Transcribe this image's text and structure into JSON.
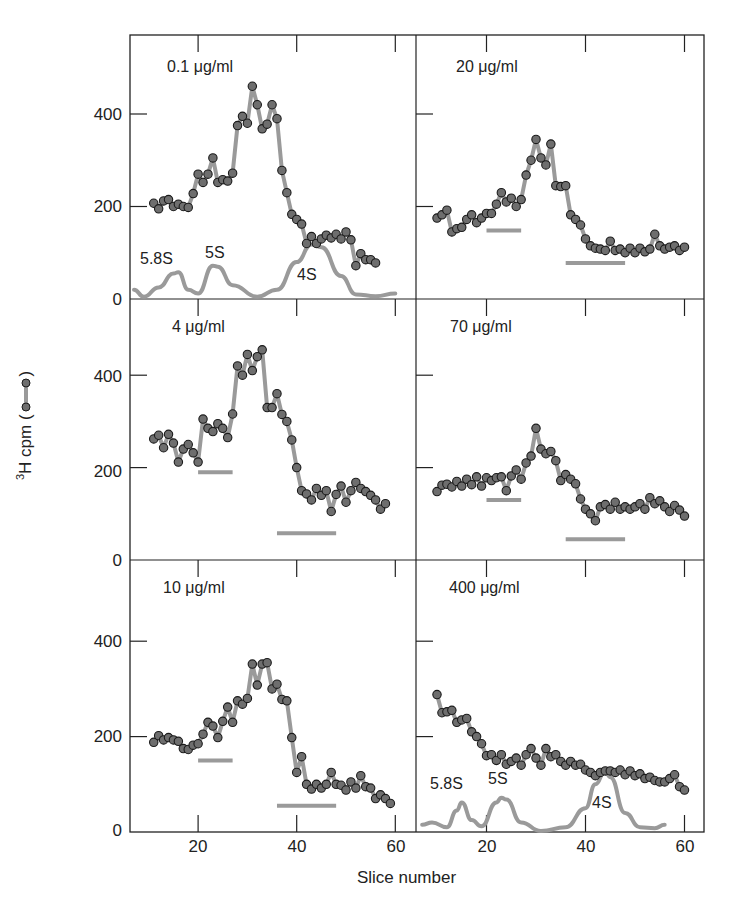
{
  "figure": {
    "xlabel": "Slice number",
    "ylabel_sup": "3",
    "ylabel_main": "H cpm (",
    "ylabel_end": ")",
    "legend_symbol": "line-with-dots",
    "colors": {
      "frame": "#222222",
      "trace_line": "#9a9a9a",
      "dot_fill": "#6e6e6e",
      "dot_stroke": "#1a1a1a",
      "marker_curve": "#9a9a9a",
      "bar": "#9a9a9a"
    }
  },
  "axes": {
    "y_ticks": [
      "0",
      "200",
      "400"
    ],
    "x_ticks": [
      "20",
      "40",
      "60"
    ]
  },
  "chart_data": {
    "type": "line",
    "title": "",
    "xlabel": "Slice number",
    "ylabel": "3H cpm",
    "x_ticks": [
      20,
      40,
      60
    ],
    "y_ticks": [
      0,
      200,
      400
    ],
    "grid": false,
    "layout": "3 rows x 2 columns of panels, shared axes",
    "panels": [
      {
        "label": "0.1 μg/ml",
        "row": 0,
        "col": 0,
        "x": [
          11,
          12,
          13,
          14,
          15,
          16,
          17,
          18,
          19,
          20,
          21,
          22,
          23,
          24,
          25,
          26,
          27,
          28,
          29,
          30,
          31,
          32,
          33,
          34,
          35,
          36,
          37,
          38,
          39,
          40,
          41,
          42,
          43,
          44,
          45,
          46,
          47,
          48,
          49,
          50,
          51,
          52,
          53,
          54,
          55,
          56,
          57,
          58,
          59,
          60
        ],
        "values": [
          207,
          195,
          212,
          215,
          200,
          205,
          200,
          198,
          228,
          270,
          252,
          270,
          305,
          252,
          258,
          255,
          272,
          375,
          395,
          380,
          460,
          420,
          368,
          378,
          420,
          390,
          278,
          230,
          183,
          172,
          162,
          120,
          135,
          120,
          130,
          138,
          132,
          140,
          130,
          145,
          128,
          72,
          98,
          85,
          85,
          78,
          null,
          null,
          null,
          null
        ],
        "markers": {
          "curve": [
            [
              7,
              20
            ],
            [
              9,
              5
            ],
            [
              12,
              25
            ],
            [
              15,
              55
            ],
            [
              16,
              58
            ],
            [
              18,
              20
            ],
            [
              20,
              12
            ],
            [
              23,
              72
            ],
            [
              24,
              70
            ],
            [
              27,
              30
            ],
            [
              32,
              5
            ],
            [
              36,
              20
            ],
            [
              40,
              80
            ],
            [
              43,
              118
            ],
            [
              45,
              112
            ],
            [
              49,
              50
            ],
            [
              52,
              10
            ],
            [
              56,
              6
            ],
            [
              60,
              12
            ]
          ],
          "labels": [
            {
              "text": "5.8S",
              "x": 14,
              "y": 92
            },
            {
              "text": "5S",
              "x": 24,
              "y": 100
            },
            {
              "text": "4S",
              "x": 44,
              "y": 48
            }
          ]
        },
        "bars": []
      },
      {
        "label": "20 μg/ml",
        "row": 0,
        "col": 1,
        "x": [
          10,
          11,
          12,
          13,
          14,
          15,
          16,
          17,
          18,
          19,
          20,
          21,
          22,
          23,
          24,
          25,
          26,
          27,
          28,
          29,
          30,
          31,
          32,
          33,
          34,
          35,
          36,
          37,
          38,
          39,
          40,
          41,
          42,
          43,
          44,
          45,
          46,
          47,
          48,
          49,
          50,
          51,
          52,
          53,
          54,
          55,
          56,
          57,
          58,
          59,
          60
        ],
        "values": [
          175,
          182,
          192,
          145,
          152,
          155,
          172,
          182,
          165,
          175,
          185,
          185,
          205,
          230,
          210,
          218,
          200,
          215,
          268,
          300,
          345,
          305,
          290,
          335,
          245,
          243,
          245,
          182,
          172,
          160,
          130,
          115,
          110,
          108,
          105,
          125,
          105,
          108,
          100,
          110,
          100,
          110,
          102,
          108,
          140,
          115,
          108,
          112,
          115,
          105,
          112
        ],
        "markers": null,
        "bars": [
          {
            "x0": 20,
            "x1": 27,
            "y": 148
          },
          {
            "x0": 36,
            "x1": 48,
            "y": 78
          }
        ]
      },
      {
        "label": "4 μg/ml",
        "row": 1,
        "col": 0,
        "x": [
          11,
          12,
          13,
          14,
          15,
          16,
          17,
          18,
          19,
          20,
          21,
          22,
          23,
          24,
          25,
          26,
          27,
          28,
          29,
          30,
          31,
          32,
          33,
          34,
          35,
          36,
          37,
          38,
          39,
          40,
          41,
          42,
          43,
          44,
          45,
          46,
          47,
          48,
          49,
          50,
          51,
          52,
          53,
          54,
          55,
          56,
          57,
          58,
          59,
          60
        ],
        "values": [
          262,
          270,
          243,
          272,
          253,
          212,
          240,
          250,
          232,
          212,
          305,
          285,
          278,
          295,
          285,
          265,
          316,
          420,
          400,
          445,
          410,
          440,
          455,
          330,
          330,
          360,
          315,
          300,
          260,
          200,
          150,
          143,
          130,
          155,
          140,
          150,
          105,
          142,
          160,
          125,
          150,
          168,
          155,
          148,
          140,
          130,
          110,
          122,
          null,
          null
        ],
        "markers": null,
        "bars": [
          {
            "x0": 20,
            "x1": 27,
            "y": 190
          },
          {
            "x0": 36,
            "x1": 48,
            "y": 58
          }
        ]
      },
      {
        "label": "70 μg/ml",
        "row": 1,
        "col": 1,
        "x": [
          10,
          11,
          12,
          13,
          14,
          15,
          16,
          17,
          18,
          19,
          20,
          21,
          22,
          23,
          24,
          25,
          26,
          27,
          28,
          29,
          30,
          31,
          32,
          33,
          34,
          35,
          36,
          37,
          38,
          39,
          40,
          41,
          42,
          43,
          44,
          45,
          46,
          47,
          48,
          49,
          50,
          51,
          52,
          53,
          54,
          55,
          56,
          57,
          58,
          59,
          60
        ],
        "values": [
          148,
          162,
          164,
          158,
          170,
          160,
          175,
          163,
          180,
          160,
          178,
          172,
          178,
          180,
          150,
          182,
          195,
          175,
          210,
          225,
          285,
          240,
          230,
          235,
          215,
          172,
          185,
          175,
          165,
          132,
          110,
          100,
          85,
          115,
          120,
          110,
          125,
          110,
          115,
          110,
          115,
          122,
          110,
          135,
          122,
          128,
          115,
          105,
          118,
          108,
          95
        ],
        "markers": null,
        "bars": [
          {
            "x0": 20,
            "x1": 27,
            "y": 130
          },
          {
            "x0": 36,
            "x1": 48,
            "y": 45
          }
        ]
      },
      {
        "label": "10 μg/ml",
        "row": 2,
        "col": 0,
        "x": [
          11,
          12,
          13,
          14,
          15,
          16,
          17,
          18,
          19,
          20,
          21,
          22,
          23,
          24,
          25,
          26,
          27,
          28,
          29,
          30,
          31,
          32,
          33,
          34,
          35,
          36,
          37,
          38,
          39,
          40,
          41,
          42,
          43,
          44,
          45,
          46,
          47,
          48,
          49,
          50,
          51,
          52,
          53,
          54,
          55,
          56,
          57,
          58,
          59,
          60
        ],
        "values": [
          188,
          202,
          193,
          198,
          193,
          190,
          175,
          173,
          182,
          185,
          205,
          230,
          222,
          198,
          232,
          262,
          230,
          275,
          268,
          280,
          352,
          308,
          352,
          355,
          300,
          310,
          278,
          275,
          198,
          125,
          158,
          100,
          90,
          100,
          92,
          100,
          125,
          100,
          98,
          88,
          105,
          92,
          118,
          95,
          92,
          70,
          78,
          70,
          60,
          null
        ],
        "markers": null,
        "bars": [
          {
            "x0": 20,
            "x1": 27,
            "y": 150
          },
          {
            "x0": 36,
            "x1": 48,
            "y": 55
          }
        ]
      },
      {
        "label": "400 μg/ml",
        "row": 2,
        "col": 1,
        "x": [
          10,
          11,
          12,
          13,
          14,
          15,
          16,
          17,
          18,
          19,
          20,
          21,
          22,
          23,
          24,
          25,
          26,
          27,
          28,
          29,
          30,
          31,
          32,
          33,
          34,
          35,
          36,
          37,
          38,
          39,
          40,
          41,
          42,
          43,
          44,
          45,
          46,
          47,
          48,
          49,
          50,
          51,
          52,
          53,
          54,
          55,
          56,
          57,
          58,
          59,
          60
        ],
        "values": [
          288,
          250,
          252,
          255,
          230,
          235,
          238,
          210,
          200,
          185,
          160,
          162,
          150,
          162,
          142,
          148,
          155,
          140,
          162,
          175,
          155,
          140,
          175,
          158,
          162,
          148,
          140,
          148,
          140,
          142,
          130,
          125,
          118,
          125,
          128,
          128,
          125,
          130,
          120,
          128,
          118,
          122,
          112,
          115,
          108,
          105,
          105,
          112,
          120,
          95,
          88
        ],
        "markers": {
          "curve": [
            [
              7,
              15
            ],
            [
              9,
              20
            ],
            [
              12,
              10
            ],
            [
              14,
              45
            ],
            [
              15,
              62
            ],
            [
              17,
              25
            ],
            [
              19,
              12
            ],
            [
              22,
              62
            ],
            [
              23,
              72
            ],
            [
              24,
              68
            ],
            [
              27,
              20
            ],
            [
              31,
              2
            ],
            [
              36,
              10
            ],
            [
              40,
              50
            ],
            [
              42,
              100
            ],
            [
              44,
              128
            ],
            [
              45,
              115
            ],
            [
              48,
              40
            ],
            [
              51,
              10
            ],
            [
              54,
              8
            ],
            [
              56,
              15
            ]
          ],
          "labels": [
            {
              "text": "5.8S",
              "x": 11,
              "y": 110
            },
            {
              "text": "5S",
              "x": 22,
              "y": 118
            },
            {
              "text": "4S",
              "x": 42,
              "y": 45
            }
          ]
        },
        "bars": []
      }
    ]
  }
}
